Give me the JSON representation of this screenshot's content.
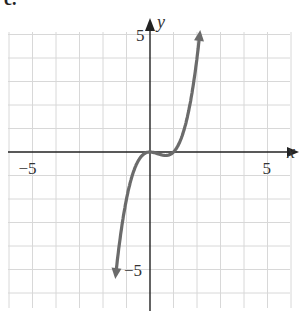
{
  "figure_label": "c.",
  "chart_data": {
    "type": "line",
    "title": "",
    "function": "y = x^3 - x^2",
    "xlabel": "x",
    "ylabel": "y",
    "xlim": [
      -6,
      6
    ],
    "ylim": [
      -6,
      6
    ],
    "grid": true,
    "x_ticks": [
      {
        "value": -5,
        "label": "−5"
      },
      {
        "value": 5,
        "label": "5"
      }
    ],
    "y_ticks": [
      {
        "value": 5,
        "label": "5"
      },
      {
        "value": -5,
        "label": "−5"
      }
    ],
    "series": [
      {
        "name": "f(x)",
        "x": [
          -1.45,
          -1.2,
          -1.0,
          -0.8,
          -0.6,
          -0.4,
          -0.2,
          0,
          0.2,
          0.4,
          0.6,
          0.67,
          0.8,
          1.0,
          1.2,
          1.4,
          1.6,
          1.8,
          2.0,
          2.1
        ],
        "y": [
          -5.15,
          -3.17,
          -2.0,
          -1.15,
          -0.58,
          -0.22,
          -0.05,
          0,
          -0.03,
          -0.1,
          -0.14,
          -0.15,
          -0.13,
          0,
          0.29,
          0.78,
          1.54,
          2.59,
          4.0,
          4.85
        ],
        "end_arrows": true
      }
    ]
  },
  "colors": {
    "axis": "#222222",
    "grid": "#d8d8d8",
    "curve": "#6b6b6b",
    "text": "#333333"
  }
}
